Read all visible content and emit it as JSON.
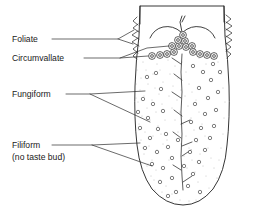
{
  "figure": {
    "view": "dorsal surface of the tongue",
    "width": 253,
    "height": 215,
    "background_color": "#ffffff",
    "line_color": "#1f1f1f",
    "stipple_color": "#8a8a8a",
    "papilla_fill": "#cfcfcf"
  },
  "labels": [
    {
      "id": "foliate",
      "text": "Foliate",
      "lines": [
        "Foliate"
      ],
      "x": 12,
      "y": 42,
      "leader_count": 2
    },
    {
      "id": "circumvallate",
      "text": "Circumvallate",
      "lines": [
        "Circumvallate"
      ],
      "x": 12,
      "y": 61,
      "leader_count": 2
    },
    {
      "id": "fungiform",
      "text": "Fungiform",
      "lines": [
        "Fungiform"
      ],
      "x": 12,
      "y": 97,
      "leader_count": 2
    },
    {
      "id": "filiform",
      "text": "Filiform",
      "lines": [
        "Filiform",
        "(no taste bud)"
      ],
      "x": 12,
      "y": 148,
      "line2_y": 160,
      "leader_count": 2
    }
  ],
  "label_text": {
    "foliate": "Foliate",
    "circumvallate": "Circumvallate",
    "fungiform": "Fungiform",
    "filiform_line1": "Filiform",
    "filiform_line2": "(no taste bud)"
  },
  "structures": {
    "circumvallate_papillae_count": 15,
    "circumvallate_arrangement": "V-shaped row across the sulcus terminalis",
    "fungiform_papillae_count": 46,
    "fungiform_description": "small open circles scattered over the anterior two-thirds",
    "foliate_description": "vertical folds along the posterior lateral margins, both sides",
    "filiform_description": "dense stippling covering the dorsal surface",
    "median_sulcus": "vertical midline groove with angled lateral branches"
  }
}
